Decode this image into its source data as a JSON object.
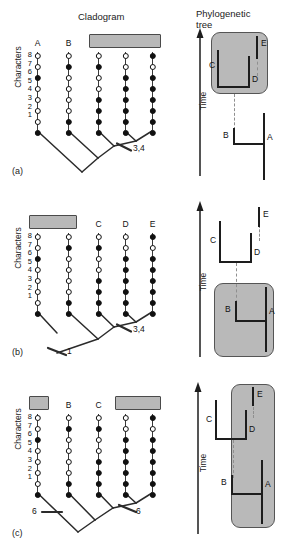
{
  "figure": {
    "headers": {
      "cladogram": "Cladogram",
      "phylogenetic_tree": "Phylogenetic\ntree"
    },
    "axis_titles": {
      "characters": "Characters",
      "time": "Time"
    },
    "character_numbers": [
      "8",
      "7",
      "6",
      "5",
      "4",
      "3",
      "2",
      "1"
    ],
    "taxa": [
      "A",
      "B",
      "C",
      "D",
      "E"
    ],
    "colors": {
      "highlight_fill": "#b8b8b8",
      "highlight_border": "#4a4a4a",
      "line": "#1d1d1d",
      "circle_filled": "#111111",
      "circle_open": "#ffffff",
      "dashed_connector": "#8f8f8f",
      "background": "#ffffff"
    },
    "character_matrix": {
      "note": "true = filled (derived), false = open (primitive); listed character 8 down to 1",
      "A": [
        false,
        false,
        true,
        false,
        false,
        false,
        false,
        true
      ],
      "B": [
        false,
        true,
        false,
        false,
        false,
        false,
        true,
        true
      ],
      "C": [
        false,
        true,
        false,
        false,
        true,
        true,
        true,
        true
      ],
      "D": [
        false,
        false,
        true,
        true,
        true,
        true,
        true,
        true
      ],
      "E": [
        true,
        false,
        true,
        true,
        true,
        true,
        true,
        true
      ]
    }
  },
  "panels": [
    {
      "id": "a",
      "label": "(a)",
      "cladogram": {
        "highlight_boxes": [
          {
            "taxa": [
              "C",
              "D",
              "E"
            ],
            "label_text": "C D E"
          }
        ],
        "tick_marks": [
          {
            "label": "3,4",
            "side": "right"
          }
        ]
      },
      "phylogenetic_tree": {
        "labels": [
          "E",
          "C",
          "D",
          "B",
          "A"
        ],
        "highlight_box": {
          "encloses": [
            "C",
            "D",
            "E"
          ]
        }
      }
    },
    {
      "id": "b",
      "label": "(b)",
      "cladogram": {
        "highlight_boxes": [
          {
            "taxa": [
              "A",
              "B"
            ],
            "label_text": "A B"
          }
        ],
        "tick_marks": [
          {
            "label": "3,4",
            "side": "right"
          },
          {
            "label": "1",
            "side": "right"
          }
        ]
      },
      "phylogenetic_tree": {
        "labels": [
          "E",
          "C",
          "D",
          "B",
          "A"
        ],
        "highlight_box": {
          "encloses": [
            "A",
            "B"
          ]
        }
      }
    },
    {
      "id": "c",
      "label": "(c)",
      "cladogram": {
        "highlight_boxes": [
          {
            "taxa": [
              "A"
            ],
            "label_text": "A"
          },
          {
            "taxa": [
              "D",
              "E"
            ],
            "label_text": "D E"
          }
        ],
        "tick_marks": [
          {
            "label": "6",
            "side": "left"
          },
          {
            "label": "6",
            "side": "right"
          }
        ]
      },
      "phylogenetic_tree": {
        "labels": [
          "E",
          "C",
          "D",
          "B",
          "A"
        ],
        "highlight_box": {
          "encloses": [
            "A",
            "D",
            "E"
          ]
        }
      }
    }
  ]
}
